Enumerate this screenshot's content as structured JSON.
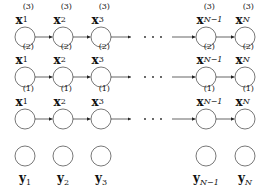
{
  "diagram": {
    "columns": [
      {
        "id": "1",
        "subscript": "1"
      },
      {
        "id": "2",
        "subscript": "2"
      },
      {
        "id": "3",
        "subscript": "3"
      },
      {
        "id": "N-1",
        "subscript": "N−1"
      },
      {
        "id": "N",
        "subscript": "N"
      }
    ],
    "chains": [
      {
        "layer": "3",
        "variable": "x",
        "superscript": "(3)"
      },
      {
        "layer": "2",
        "variable": "x",
        "superscript": "(2)"
      },
      {
        "layer": "1",
        "variable": "x",
        "superscript": "(1)"
      }
    ],
    "observations": {
      "variable": "y"
    },
    "ellipsis": "· · ·",
    "colors": {
      "stroke": "#555555",
      "arrow": "#222222",
      "text": "#111111"
    }
  }
}
